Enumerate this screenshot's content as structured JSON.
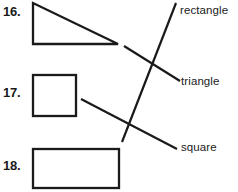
{
  "worksheet": {
    "type": "matching-exercise",
    "ink_color": "#1a1a1a",
    "background_color": "#ffffff",
    "items": [
      {
        "number": "16.",
        "shape_name": "triangle",
        "shape_kind": "right-triangle",
        "points": "33,3 33,44 118,44"
      },
      {
        "number": "17.",
        "shape_name": "square",
        "shape_kind": "square",
        "x": 33,
        "y": 75,
        "w": 43,
        "h": 41
      },
      {
        "number": "18.",
        "shape_name": "rectangle",
        "shape_kind": "rectangle",
        "x": 33,
        "y": 149,
        "w": 86,
        "h": 39
      }
    ],
    "labels": [
      {
        "id": "rectangle",
        "text": "rectangle"
      },
      {
        "id": "triangle",
        "text": "triangle"
      },
      {
        "id": "square",
        "text": "square"
      }
    ],
    "match_lines": [
      {
        "from_item": "18.",
        "to_label": "rectangle",
        "x1": 122,
        "y1": 142,
        "x2": 176,
        "y2": 3
      },
      {
        "from_item": "16.",
        "to_label": "triangle",
        "x1": 124,
        "y1": 46,
        "x2": 180,
        "y2": 81
      },
      {
        "from_item": "17.",
        "to_label": "square",
        "x1": 81,
        "y1": 99,
        "x2": 177,
        "y2": 149
      }
    ]
  }
}
